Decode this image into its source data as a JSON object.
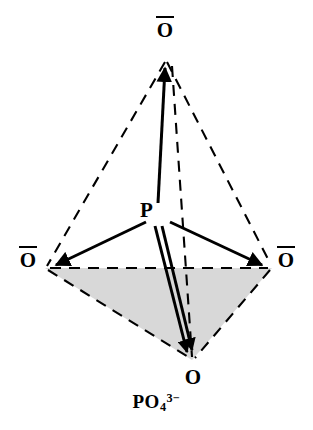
{
  "figure": {
    "background_color": "#ffffff",
    "stroke_color": "#000000",
    "shaded_face_color": "#d8d8d8"
  },
  "atoms": {
    "center": {
      "symbol": "P",
      "name": "phosphorus-center",
      "charge_bar": false,
      "x": 157,
      "y": 215
    },
    "oxygen_top": {
      "symbol": "O",
      "name": "oxygen-top",
      "charge_bar": true,
      "x": 165,
      "y": 60
    },
    "oxygen_left": {
      "symbol": "O",
      "name": "oxygen-left",
      "charge_bar": true,
      "x": 45,
      "y": 268
    },
    "oxygen_right": {
      "symbol": "O",
      "name": "oxygen-right",
      "charge_bar": true,
      "x": 272,
      "y": 268
    },
    "oxygen_bottom": {
      "symbol": "O",
      "name": "oxygen-bottom",
      "charge_bar": false,
      "x": 192,
      "y": 360
    }
  },
  "bonds": [
    {
      "from": "P",
      "to": "O-top",
      "type": "single-arrow",
      "order": 1
    },
    {
      "from": "P",
      "to": "O-left",
      "type": "single-arrow",
      "order": 1
    },
    {
      "from": "P",
      "to": "O-right",
      "type": "single-arrow",
      "order": 1
    },
    {
      "from": "P",
      "to": "O-bottom",
      "type": "double-arrow",
      "order": 2
    }
  ],
  "wireframe_edges": [
    {
      "from": "O-top",
      "to": "O-left",
      "style": "dashed"
    },
    {
      "from": "O-top",
      "to": "O-right",
      "style": "dashed"
    },
    {
      "from": "O-top",
      "to": "O-bottom",
      "style": "dashed"
    },
    {
      "from": "O-left",
      "to": "O-right",
      "style": "dashed"
    },
    {
      "from": "O-left",
      "to": "O-bottom",
      "style": "dashed"
    },
    {
      "from": "O-right",
      "to": "O-bottom",
      "style": "dashed"
    }
  ],
  "caption": {
    "base": "PO",
    "subscript": "4",
    "superscript": "3−",
    "full_text": "PO4 3−"
  }
}
